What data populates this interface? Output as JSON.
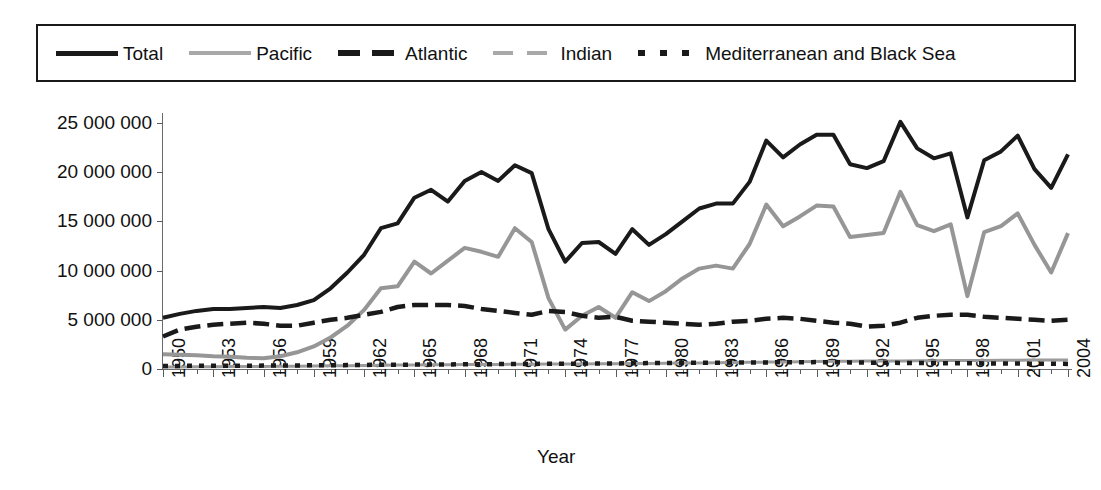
{
  "chart_data": {
    "type": "line",
    "title": "",
    "xlabel": "Year",
    "ylabel": "Metric tons",
    "xlim": [
      1950,
      2004
    ],
    "ylim": [
      0,
      26000000
    ],
    "ytick_values": [
      0,
      5000000,
      10000000,
      15000000,
      20000000,
      25000000
    ],
    "ytick_labels": [
      "0",
      "5 000 000",
      "10 000 000",
      "15 000 000",
      "20 000 000",
      "25 000 000"
    ],
    "x": [
      1950,
      1951,
      1952,
      1953,
      1954,
      1955,
      1956,
      1957,
      1958,
      1959,
      1960,
      1961,
      1962,
      1963,
      1964,
      1965,
      1966,
      1967,
      1968,
      1969,
      1970,
      1971,
      1972,
      1973,
      1974,
      1975,
      1976,
      1977,
      1978,
      1979,
      1980,
      1981,
      1982,
      1983,
      1984,
      1985,
      1986,
      1987,
      1988,
      1989,
      1990,
      1991,
      1992,
      1993,
      1994,
      1995,
      1996,
      1997,
      1998,
      1999,
      2000,
      2001,
      2002,
      2003,
      2004
    ],
    "xtick_labels": [
      "1950",
      "1953",
      "1956",
      "1959",
      "1962",
      "1965",
      "1968",
      "1971",
      "1974",
      "1977",
      "1980",
      "1983",
      "1986",
      "1989",
      "1992",
      "1995",
      "1998",
      "2001",
      "2004"
    ],
    "grid": false,
    "legend_position": "top",
    "series": [
      {
        "name": "Total",
        "style": "solid",
        "color": "#1a1a1a",
        "values": [
          5200000,
          5600000,
          5900000,
          6100000,
          6100000,
          6200000,
          6300000,
          6200000,
          6500000,
          7000000,
          8200000,
          9800000,
          11600000,
          14300000,
          14800000,
          17400000,
          18200000,
          17000000,
          19100000,
          20000000,
          19100000,
          20700000,
          19900000,
          14200000,
          10900000,
          12800000,
          12900000,
          11700000,
          14200000,
          12600000,
          13700000,
          15000000,
          16300000,
          16800000,
          16800000,
          19000000,
          23200000,
          21500000,
          22800000,
          23800000,
          23800000,
          20800000,
          20400000,
          21100000,
          25100000,
          22400000,
          21400000,
          21900000,
          15400000,
          21200000,
          22100000,
          23700000,
          20300000,
          18400000,
          21800000
        ]
      },
      {
        "name": "Pacific",
        "style": "solid",
        "color": "#969696",
        "values": [
          1500000,
          1450000,
          1400000,
          1300000,
          1250000,
          1150000,
          1100000,
          1300000,
          1700000,
          2300000,
          3200000,
          4400000,
          6000000,
          8200000,
          8400000,
          10900000,
          9700000,
          11000000,
          12300000,
          11900000,
          11400000,
          14300000,
          12900000,
          7200000,
          4000000,
          5400000,
          6300000,
          5200000,
          7800000,
          6900000,
          7900000,
          9200000,
          10200000,
          10500000,
          10200000,
          12700000,
          16700000,
          14500000,
          15500000,
          16600000,
          16500000,
          13400000,
          13600000,
          13800000,
          18000000,
          14600000,
          14000000,
          14700000,
          7400000,
          13900000,
          14500000,
          15800000,
          12600000,
          9800000,
          13800000
        ]
      },
      {
        "name": "Atlantic",
        "style": "dashed",
        "color": "#1a1a1a",
        "values": [
          3300000,
          4000000,
          4300000,
          4500000,
          4600000,
          4700000,
          4600000,
          4400000,
          4400000,
          4700000,
          5000000,
          5200000,
          5500000,
          5800000,
          6300000,
          6500000,
          6500000,
          6500000,
          6400000,
          6100000,
          5900000,
          5700000,
          5500000,
          5900000,
          5800000,
          5400000,
          5200000,
          5300000,
          4900000,
          4800000,
          4700000,
          4600000,
          4500000,
          4600000,
          4800000,
          4900000,
          5100000,
          5200000,
          5100000,
          4900000,
          4700000,
          4600000,
          4300000,
          4400000,
          4700000,
          5200000,
          5400000,
          5500000,
          5500000,
          5300000,
          5200000,
          5100000,
          5000000,
          4900000,
          5000000
        ]
      },
      {
        "name": "Indian",
        "style": "solid",
        "color": "#9b9b9b",
        "values": [
          200000,
          210000,
          220000,
          230000,
          240000,
          250000,
          260000,
          270000,
          280000,
          300000,
          320000,
          340000,
          360000,
          380000,
          400000,
          420000,
          430000,
          440000,
          450000,
          460000,
          470000,
          480000,
          490000,
          500000,
          510000,
          520000,
          530000,
          540000,
          550000,
          570000,
          590000,
          600000,
          620000,
          640000,
          660000,
          680000,
          700000,
          720000,
          740000,
          760000,
          780000,
          790000,
          800000,
          810000,
          820000,
          830000,
          840000,
          850000,
          860000,
          870000,
          880000,
          890000,
          900000,
          910000,
          920000
        ]
      },
      {
        "name": "Mediterranean and Black Sea",
        "style": "dotted",
        "color": "#1a1a1a",
        "values": [
          300000,
          310000,
          320000,
          320000,
          330000,
          340000,
          350000,
          360000,
          370000,
          380000,
          390000,
          400000,
          420000,
          430000,
          440000,
          450000,
          460000,
          470000,
          480000,
          490000,
          500000,
          510000,
          520000,
          530000,
          540000,
          550000,
          560000,
          570000,
          580000,
          600000,
          610000,
          620000,
          630000,
          640000,
          650000,
          660000,
          670000,
          680000,
          690000,
          700000,
          690000,
          670000,
          650000,
          630000,
          620000,
          610000,
          600000,
          590000,
          580000,
          570000,
          560000,
          550000,
          540000,
          530000,
          520000
        ]
      }
    ]
  },
  "legend": {
    "entries": [
      {
        "label": "Total",
        "swatch": "solid-dark"
      },
      {
        "label": "Pacific",
        "swatch": "solid-gray"
      },
      {
        "label": "Atlantic",
        "swatch": "dashed-dark"
      },
      {
        "label": "Indian",
        "swatch": "dashed-gray"
      },
      {
        "label": "Mediterranean and Black Sea",
        "swatch": "dotted-dark"
      }
    ]
  }
}
